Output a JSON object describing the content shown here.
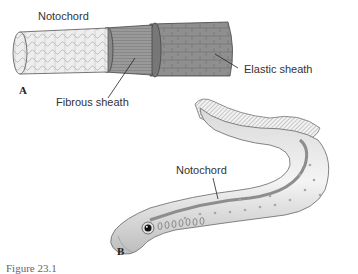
{
  "figure": {
    "caption": "Figure 23.1",
    "panel_a": {
      "letter": "A",
      "labels": {
        "notochord": "Notochord",
        "fibrous_sheath": "Fibrous sheath",
        "elastic_sheath": "Elastic sheath"
      }
    },
    "panel_b": {
      "letter": "B",
      "labels": {
        "notochord": "Notochord"
      }
    }
  }
}
